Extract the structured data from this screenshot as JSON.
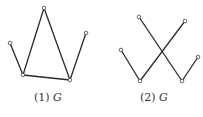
{
  "figures": [
    {
      "label_num": "(1)",
      "label_var": "G",
      "nodes": [
        [
          44,
          8
        ],
        [
          10,
          43
        ],
        [
          23,
          75
        ],
        [
          70,
          80
        ],
        [
          86,
          33
        ]
      ],
      "edges": [
        [
          1,
          2
        ],
        [
          2,
          0
        ],
        [
          0,
          3
        ],
        [
          2,
          3
        ],
        [
          3,
          4
        ]
      ]
    },
    {
      "label_num": "(2)",
      "label_var": "G",
      "nodes": [
        [
          139,
          17
        ],
        [
          185,
          21
        ],
        [
          121,
          50
        ],
        [
          140,
          81
        ],
        [
          182,
          81
        ],
        [
          198,
          57
        ]
      ],
      "edges": [
        [
          2,
          3
        ],
        [
          3,
          1
        ],
        [
          0,
          4
        ],
        [
          4,
          5
        ]
      ]
    }
  ],
  "colors": {
    "edge": "#2a2a2a",
    "node_fill": "#ffffff",
    "node_stroke": "#444444"
  }
}
